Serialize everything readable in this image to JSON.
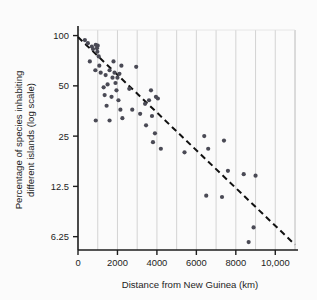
{
  "chart_data": {
    "type": "scatter",
    "title": "",
    "xlabel": "Distance from New Guinea (km)",
    "ylabel": "Percentage of species inhabiting different islands (log scale)",
    "ylabel_line1": "Percentage of species inhabiting",
    "ylabel_line2": "different islands (log scale)",
    "xlim": [
      0,
      11000
    ],
    "ylim": [
      5.2,
      108
    ],
    "yscale": "log",
    "xticks": [
      0,
      2000,
      4000,
      6000,
      8000,
      10000
    ],
    "xticklabels": [
      "0",
      "2000",
      "4000",
      "6000",
      "8000",
      "10,000"
    ],
    "yticks": [
      100,
      50,
      25,
      12.5,
      6.25
    ],
    "yticklabels": [
      "100",
      "50",
      "25",
      "12.5",
      "6.25"
    ],
    "grid": "vertical-only",
    "gridlines_x": [
      1000,
      2000,
      3000,
      4000,
      5000,
      6000,
      7000,
      8000,
      9000,
      10000,
      11000
    ],
    "legend": "none",
    "point_color": "#4a4a55",
    "line_color": "#111111",
    "grid_color": "#c9c9c9",
    "axis_color": "#1d1d1d",
    "trendline": {
      "style": "dashed",
      "x": [
        0,
        11000
      ],
      "y": [
        98,
        5.6
      ]
    },
    "points": [
      {
        "x": 350,
        "y": 94
      },
      {
        "x": 500,
        "y": 90
      },
      {
        "x": 700,
        "y": 86
      },
      {
        "x": 760,
        "y": 83
      },
      {
        "x": 900,
        "y": 88
      },
      {
        "x": 960,
        "y": 84
      },
      {
        "x": 980,
        "y": 80
      },
      {
        "x": 1000,
        "y": 87
      },
      {
        "x": 1050,
        "y": 75
      },
      {
        "x": 600,
        "y": 70
      },
      {
        "x": 880,
        "y": 62
      },
      {
        "x": 1080,
        "y": 66
      },
      {
        "x": 1150,
        "y": 60
      },
      {
        "x": 1300,
        "y": 49
      },
      {
        "x": 1350,
        "y": 44
      },
      {
        "x": 1400,
        "y": 58
      },
      {
        "x": 1450,
        "y": 38
      },
      {
        "x": 1500,
        "y": 51
      },
      {
        "x": 1600,
        "y": 62
      },
      {
        "x": 1700,
        "y": 43
      },
      {
        "x": 1750,
        "y": 56
      },
      {
        "x": 1800,
        "y": 70
      },
      {
        "x": 1850,
        "y": 60
      },
      {
        "x": 1900,
        "y": 52
      },
      {
        "x": 1950,
        "y": 47
      },
      {
        "x": 2000,
        "y": 56
      },
      {
        "x": 2050,
        "y": 41
      },
      {
        "x": 2100,
        "y": 59
      },
      {
        "x": 2150,
        "y": 36
      },
      {
        "x": 2200,
        "y": 66
      },
      {
        "x": 900,
        "y": 31
      },
      {
        "x": 1600,
        "y": 31
      },
      {
        "x": 2250,
        "y": 32
      },
      {
        "x": 2600,
        "y": 48
      },
      {
        "x": 2750,
        "y": 36
      },
      {
        "x": 2950,
        "y": 65
      },
      {
        "x": 3150,
        "y": 34
      },
      {
        "x": 3400,
        "y": 39
      },
      {
        "x": 3450,
        "y": 29
      },
      {
        "x": 3600,
        "y": 41
      },
      {
        "x": 3700,
        "y": 47
      },
      {
        "x": 3750,
        "y": 33
      },
      {
        "x": 3800,
        "y": 23
      },
      {
        "x": 3900,
        "y": 26
      },
      {
        "x": 3950,
        "y": 43
      },
      {
        "x": 4050,
        "y": 42
      },
      {
        "x": 4200,
        "y": 21
      },
      {
        "x": 5400,
        "y": 20
      },
      {
        "x": 6400,
        "y": 25
      },
      {
        "x": 6500,
        "y": 11
      },
      {
        "x": 6600,
        "y": 21
      },
      {
        "x": 7300,
        "y": 10.8
      },
      {
        "x": 7400,
        "y": 23.5
      },
      {
        "x": 7600,
        "y": 15.5
      },
      {
        "x": 8400,
        "y": 14.8
      },
      {
        "x": 8650,
        "y": 5.8
      },
      {
        "x": 8900,
        "y": 7.1
      },
      {
        "x": 9000,
        "y": 14.5
      }
    ]
  }
}
